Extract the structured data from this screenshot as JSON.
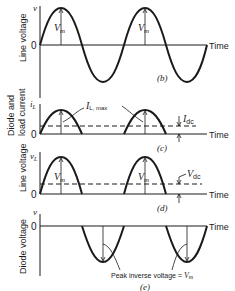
{
  "figure": {
    "panels": [
      {
        "id": "b",
        "caption": "(b)",
        "ylabel": "Line voltage",
        "yaxis_symbol": "v",
        "zero_label": "0",
        "xlabel": "Time",
        "annotations": [
          "V_m",
          "V_m"
        ]
      },
      {
        "id": "c",
        "caption": "(c)",
        "ylabel_line1": "Diode and",
        "ylabel_line2": "load current",
        "yaxis_symbol": "i_L",
        "zero_label": "0",
        "xlabel": "Time",
        "annotations": [
          "I_L, max",
          "I_dc"
        ]
      },
      {
        "id": "d",
        "caption": "(d)",
        "ylabel": "Line voltage",
        "yaxis_symbol": "v_L",
        "zero_label": "0",
        "xlabel": "Time",
        "annotations": [
          "V_m",
          "V_m",
          "V_dc"
        ]
      },
      {
        "id": "e",
        "caption": "(e)",
        "ylabel": "Diode voltage",
        "yaxis_symbol": "v",
        "zero_label": "0",
        "xlabel": "Time",
        "annotations": [
          "Peak inverse voltage = V_m"
        ]
      }
    ]
  },
  "labels": {
    "b_caption": "(b)",
    "c_caption": "(c)",
    "d_caption": "(d)",
    "e_caption": "(e)",
    "time": "Time",
    "zero": "0",
    "v": "v",
    "iL_i": "i",
    "iL_sub": "L",
    "vL_v": "v",
    "vL_sub": "L",
    "line_voltage": "Line voltage",
    "diode_and": "Diode and",
    "load_current": "load current",
    "diode_voltage": "Diode voltage",
    "vm_V": "V",
    "vm_sub": "m",
    "ilmax_I": "I",
    "ilmax_sub": "L, max",
    "idc_I": "I",
    "idc_sub": "dc",
    "vdc_V": "V",
    "vdc_sub": "dc",
    "piv": "Peak inverse voltage = ",
    "piv_V": "V",
    "piv_sub": "m"
  },
  "colors": {
    "ink": "#1a1a1a",
    "background": "#ffffff"
  }
}
